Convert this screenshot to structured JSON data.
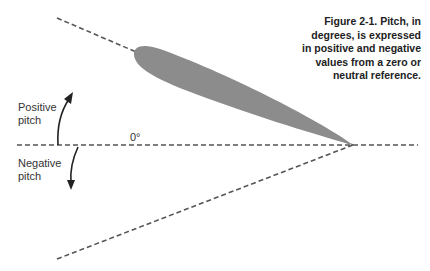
{
  "figure": {
    "caption": "Figure 2-1. Pitch, in degrees, is expressed in positive and negative values from a zero or neutral reference.",
    "caption_lines": [
      "Figure 2-1. Pitch, in",
      "degrees, is expressed",
      "in positive and negative",
      "values from a zero or",
      "neutral reference."
    ]
  },
  "labels": {
    "positive_pitch": [
      "Positive",
      "pitch"
    ],
    "negative_pitch": [
      "Negative",
      "pitch"
    ],
    "zero_reference": "0°"
  },
  "colors": {
    "airfoil_fill": "#8c8c8c",
    "dashed_line": "#555555",
    "arrow": "#222222",
    "text": "#222222"
  }
}
